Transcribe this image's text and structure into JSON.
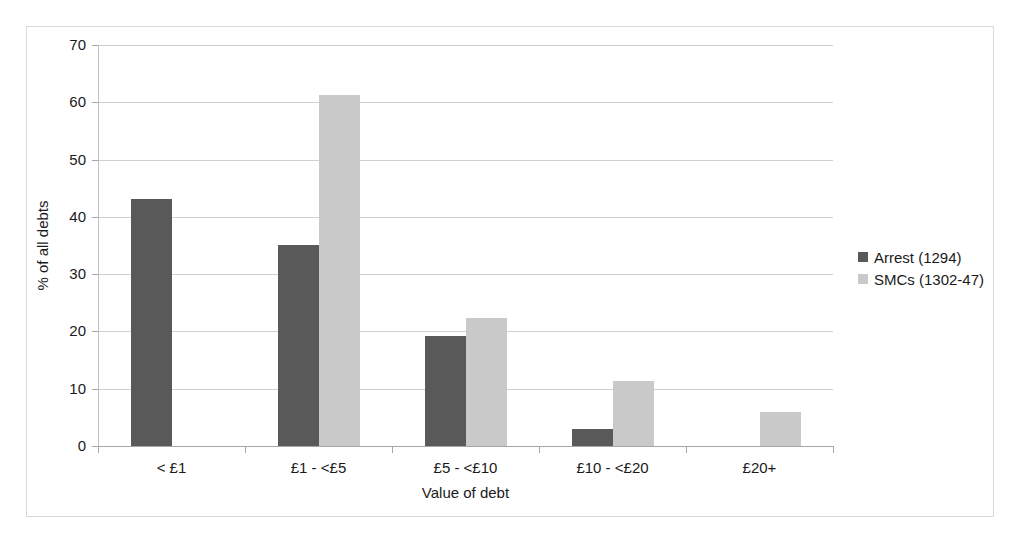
{
  "chart_data": {
    "type": "bar",
    "title": "",
    "subtitle": "",
    "xlabel": "Value of debt",
    "ylabel": "% of all debts",
    "categories": [
      "< £1",
      "£1 - <£5",
      "£5 - <£10",
      "£10 - <£20",
      "£20+"
    ],
    "series": [
      {
        "name": "Arrest (1294)",
        "color": "#595959",
        "values": [
          43.1,
          35.1,
          19.2,
          2.9,
          0
        ]
      },
      {
        "name": "SMCs (1302-47)",
        "color": "#c9c9c9",
        "values": [
          0,
          61.3,
          22.3,
          11.3,
          5.9
        ]
      }
    ],
    "ylim": [
      0,
      70
    ],
    "ytick_values": [
      0,
      10,
      20,
      30,
      40,
      50,
      60,
      70
    ],
    "ytick_labels": [
      "0",
      "10",
      "20",
      "30",
      "40",
      "50",
      "60",
      "70"
    ],
    "grid": true,
    "legend_position": "right"
  },
  "frame": {
    "border_color": "#d9d9d9",
    "background": "#ffffff"
  },
  "axes": {
    "gridline_color": "#d0d0d0",
    "axis_line_color": "#a6a6a6"
  }
}
